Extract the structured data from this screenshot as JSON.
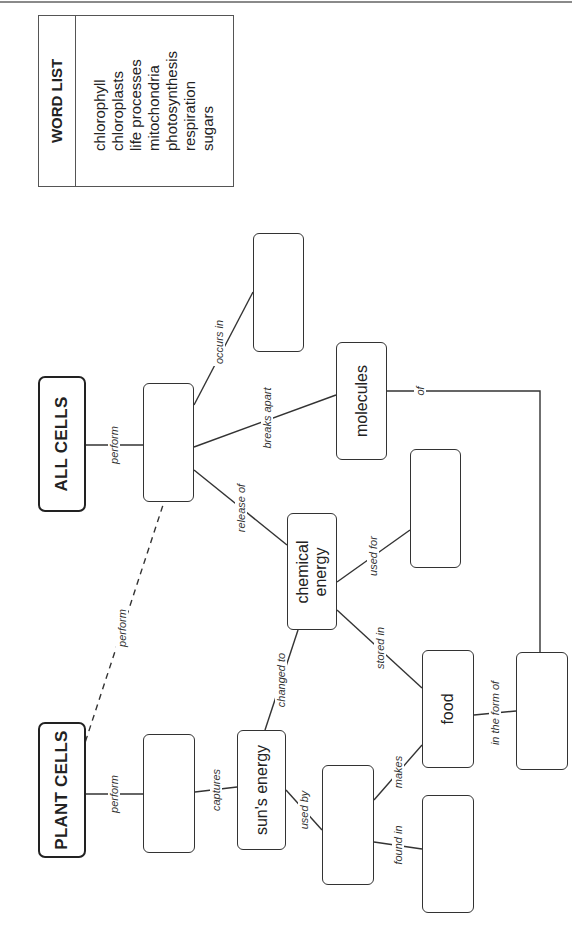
{
  "word_list": {
    "title": "WORD LIST",
    "words": [
      "chlorophyll",
      "chloroplasts",
      "life processes",
      "mitochondria",
      "photosynthesis",
      "respiration",
      "sugars"
    ]
  },
  "nodes": {
    "all_cells": "ALL CELLS",
    "plant_cells": "PLANT CELLS",
    "all_cells_process": "",
    "occurs_in_target": "",
    "molecules": "molecules",
    "chemical_energy_line1": "chemical",
    "chemical_energy_line2": "energy",
    "used_for_target": "",
    "plant_cells_process": "",
    "suns_energy": "sun's energy",
    "used_by_target": "",
    "food": "food",
    "found_in_target": "",
    "in_the_form_of_target": ""
  },
  "links": {
    "all_cells_perform": "perform",
    "occurs_in": "occurs in",
    "breaks_apart": "breaks apart",
    "release_of": "release of",
    "of": "of",
    "used_for": "used for",
    "stored_in": "stored in",
    "plant_cells_perform_dashed": "perform",
    "plant_cells_perform": "perform",
    "captures": "captures",
    "changed_to": "changed to",
    "used_by": "used by",
    "makes": "makes",
    "found_in": "found in",
    "in_the_form_of": "in the form of"
  },
  "colors": {
    "line": "#333333",
    "border": "#222222",
    "background": "#ffffff"
  }
}
